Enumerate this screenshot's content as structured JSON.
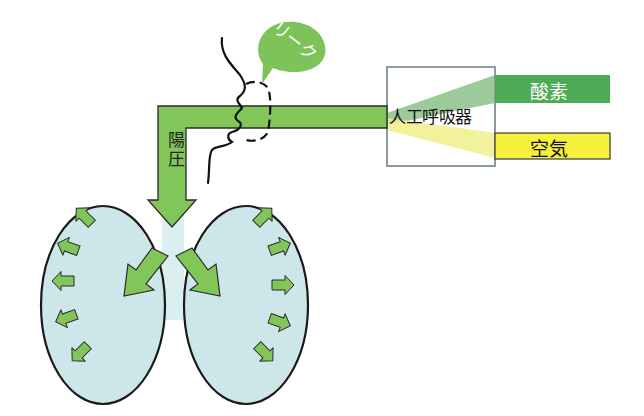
{
  "diagram": {
    "ventilator": {
      "label": "人工呼吸器"
    },
    "gases": [
      {
        "label": "酸素",
        "color": "#4faa55"
      },
      {
        "label": "空気",
        "color": "#f5f03c"
      }
    ],
    "leak": {
      "label": "リーク",
      "color": "#7dc35a"
    },
    "pressure": {
      "label": "陽圧"
    },
    "colors": {
      "tube": "#82c659",
      "lung_fill": "#cde6ea",
      "outline": "#1a1a1a"
    }
  }
}
